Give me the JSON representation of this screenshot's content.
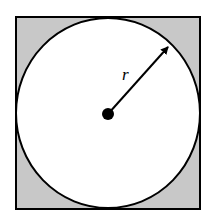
{
  "diagram": {
    "square": {
      "x": 16,
      "y": 17,
      "size": 184,
      "fill": "#c8c8c8",
      "stroke": "#000000"
    },
    "circle": {
      "cx": 108,
      "cy": 113,
      "r": 93,
      "fill": "#ffffff",
      "stroke": "#000000"
    },
    "center_dot": {
      "cx": 108,
      "cy": 114,
      "r": 6
    },
    "radius_arrow": {
      "x1": 108,
      "y1": 114,
      "x2": 170,
      "y2": 45
    },
    "radius_label": "r"
  },
  "colors": {
    "shading": "#c8c8c8",
    "line": "#000000",
    "background": "#ffffff"
  }
}
